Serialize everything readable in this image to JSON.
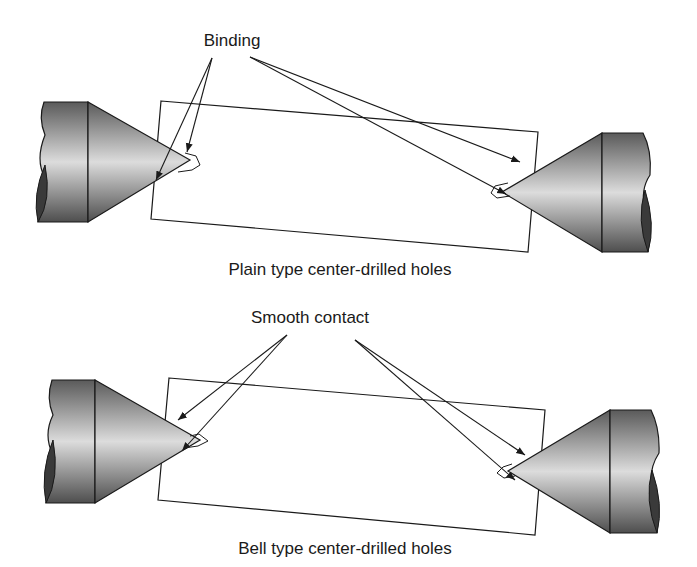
{
  "panels": [
    {
      "id": "plain",
      "callout": "Binding",
      "caption": "Plain type center-drilled holes"
    },
    {
      "id": "bell",
      "callout": "Smooth contact",
      "caption": "Bell type center-drilled holes"
    }
  ],
  "colors": {
    "stroke": "#1a1a1a",
    "metal_dark": "#4a4a4a",
    "metal_light": "#d8d8d8",
    "end_face": "#3a3a3a"
  }
}
